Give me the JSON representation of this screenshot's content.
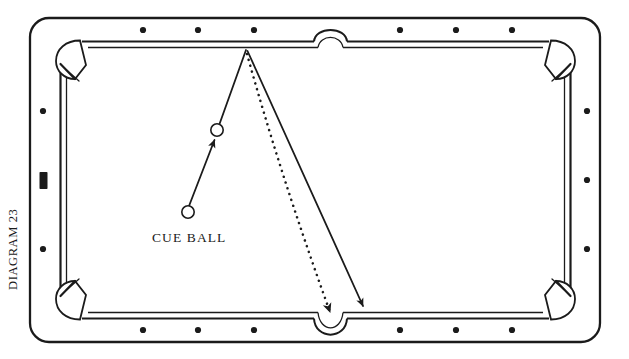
{
  "figure": {
    "caption": "DIAGRAM 23",
    "caption_orientation": "vertical-rotated-90-ccw",
    "background_color": "#ffffff",
    "ink_color": "#1b1b1b"
  },
  "table": {
    "name": "pool-table",
    "outer_frame": {
      "x": 30,
      "y": 18,
      "width": 570,
      "height": 324,
      "corner_radius": 18,
      "stroke": "#1b1b1b",
      "stroke_width": 2.2
    },
    "playing_surface": {
      "x": 60,
      "y": 40,
      "width": 510,
      "height": 280,
      "stroke": "#1b1b1b",
      "stroke_width": 2.0
    },
    "cushion_inner": {
      "x": 66,
      "y": 46,
      "width": 498,
      "height": 268,
      "stroke": "#1b1b1b",
      "stroke_width": 1.2
    },
    "pockets": [
      {
        "name": "pocket-top-left",
        "type": "corner",
        "cx": 72,
        "cy": 52
      },
      {
        "name": "pocket-top-side",
        "type": "side",
        "cx": 330,
        "cy": 40
      },
      {
        "name": "pocket-top-right",
        "type": "corner",
        "cx": 558,
        "cy": 52
      },
      {
        "name": "pocket-bottom-left",
        "type": "corner",
        "cx": 72,
        "cy": 308
      },
      {
        "name": "pocket-bottom-side",
        "type": "side",
        "cx": 330,
        "cy": 320
      },
      {
        "name": "pocket-bottom-right",
        "type": "corner",
        "cx": 558,
        "cy": 308
      }
    ],
    "diamonds": {
      "radius": 3.1,
      "fill": "#1b1b1b",
      "top": [
        {
          "cx": 143,
          "cy": 30
        },
        "",
        {
          "cx": 198,
          "cy": 30
        },
        {
          "cx": 254,
          "cy": 30
        },
        {
          "cx": 400,
          "cy": 30
        },
        {
          "cx": 456,
          "cy": 30
        },
        {
          "cx": 512,
          "cy": 30
        }
      ],
      "top_points": [
        143,
        198,
        254,
        400,
        456,
        512
      ],
      "bottom_points": [
        143,
        198,
        254,
        400,
        456,
        512
      ],
      "top_y": 30,
      "bottom_y": 330,
      "left_x": 43,
      "right_x": 587,
      "left_points": [
        111,
        249
      ],
      "right_points": [
        111,
        180,
        249
      ]
    },
    "center_marker": {
      "name": "left-rail-center-marker",
      "x": 39.5,
      "y": 172,
      "width": 8,
      "height": 17,
      "fill": "#1b1b1b",
      "shape": "filled-rectangle"
    }
  },
  "balls": [
    {
      "name": "cue-ball",
      "label": "CUE BALL",
      "cx": 188,
      "cy": 212,
      "r": 6.2,
      "fill": "#ffffff",
      "stroke": "#1b1b1b",
      "stroke_width": 1.6,
      "label_x": 152,
      "label_y": 242
    },
    {
      "name": "object-ball",
      "label": "",
      "cx": 217,
      "cy": 130,
      "r": 6.2,
      "fill": "#ffffff",
      "stroke": "#1b1b1b",
      "stroke_width": 1.6
    }
  ],
  "shot_lines": [
    {
      "name": "cue-to-object-line",
      "style": "solid",
      "x1": 189,
      "y1": 206,
      "x2": 213,
      "y2": 139,
      "stroke_width": 1.7,
      "arrowhead": "end"
    },
    {
      "name": "object-to-rail-line",
      "style": "solid",
      "x1": 220,
      "y1": 124,
      "x2": 246,
      "y2": 52,
      "stroke_width": 1.7,
      "arrowhead": "none"
    },
    {
      "name": "rail-rebound-line",
      "style": "solid",
      "x1": 247,
      "y1": 52,
      "x2": 362,
      "y2": 305,
      "stroke_width": 1.7,
      "arrowhead": "end"
    },
    {
      "name": "dotted-aim-line",
      "style": "dotted",
      "x1": 247,
      "y1": 54,
      "cx": 298,
      "cy": 190,
      "x2": 331,
      "y2": 318,
      "stroke_width": 2.4,
      "dash": "0.1 6",
      "arrowhead": "end"
    }
  ],
  "annotations": {
    "cue_ball_label": "CUE BALL",
    "diagram_label": "DIAGRAM 23"
  }
}
